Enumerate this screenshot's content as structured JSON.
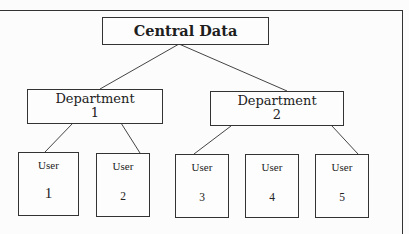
{
  "diagram": {
    "type": "hierarchy-tree",
    "root": {
      "label": "Central Data"
    },
    "departments": [
      {
        "line1": "Department",
        "line2": "1"
      },
      {
        "line1": "Department",
        "line2": "2"
      }
    ],
    "users": [
      {
        "label": "User",
        "number": "1",
        "parent": "Department 1"
      },
      {
        "label": "User",
        "number": "2",
        "parent": "Department 1"
      },
      {
        "label": "User",
        "number": "3",
        "parent": "Department 2"
      },
      {
        "label": "User",
        "number": "4",
        "parent": "Department 2"
      },
      {
        "label": "User",
        "number": "5",
        "parent": "Department 2"
      }
    ],
    "edges": [
      {
        "from": "Central Data",
        "to": "Department 1"
      },
      {
        "from": "Central Data",
        "to": "Department 2"
      },
      {
        "from": "Department 1",
        "to": "User 1"
      },
      {
        "from": "Department 1",
        "to": "User 2"
      },
      {
        "from": "Department 2",
        "to": "User 3"
      },
      {
        "from": "Department 2",
        "to": "User 5"
      }
    ],
    "colors": {
      "stroke": "#333333",
      "background": "#ffffff",
      "text": "#222222"
    }
  }
}
